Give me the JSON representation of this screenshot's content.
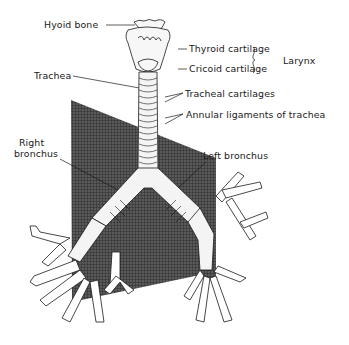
{
  "figure": {
    "labels": {
      "hyoid": "Hyoid bone",
      "thyroid": "Thyroid cartilage",
      "cricoid": "Cricoid cartilage",
      "larynx": "Larynx",
      "trachea": "Trachea",
      "tracheal_cartilages": "Tracheal cartilages",
      "annular": "Annular ligaments of trachea",
      "right_bronchus_1": "Right",
      "right_bronchus_2": "bronchus",
      "left_bronchus": "Left bronchus"
    },
    "colors": {
      "ink": "#1a1a1a",
      "panel": "#4a4a4a",
      "background": "#ffffff"
    }
  }
}
